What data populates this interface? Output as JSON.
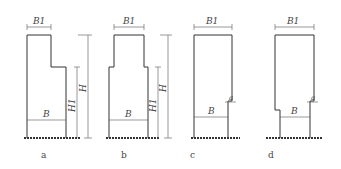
{
  "figures": [
    {
      "id": "a",
      "caption": "a",
      "labels": {
        "top_width": "B1",
        "base_width": "B",
        "step_height": "H1",
        "total_height": "H"
      }
    },
    {
      "id": "b",
      "caption": "b",
      "labels": {
        "top_width": "B1",
        "base_width": "B",
        "step_height": "H1",
        "total_height": "H"
      }
    },
    {
      "id": "c",
      "caption": "c",
      "labels": {
        "top_width": "B1",
        "base_width": "B",
        "offset": "a"
      }
    },
    {
      "id": "d",
      "caption": "d",
      "labels": {
        "top_width": "B1",
        "base_width": "B",
        "offset": "a"
      }
    }
  ]
}
